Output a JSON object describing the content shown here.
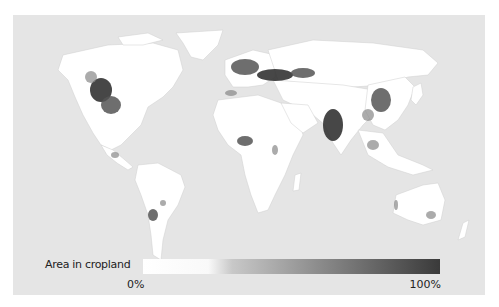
{
  "map": {
    "subject": "Global cropland distribution",
    "background_color": "#e5e5e5",
    "land_color": "#ffffff",
    "crop_color_high": "#333333"
  },
  "legend": {
    "title": "Area in cropland",
    "min_label": "0%",
    "max_label": "100%",
    "gradient": [
      "#ffffff",
      "#f8f8f8",
      "#bdbdbd",
      "#7a7a7a",
      "#3a3a3a"
    ]
  }
}
